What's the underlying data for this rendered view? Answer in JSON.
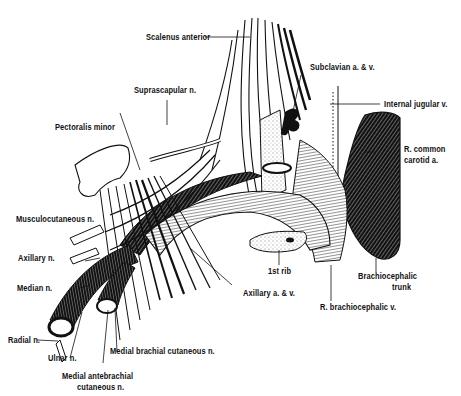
{
  "figure": {
    "type": "anatomical-illustration",
    "style": "black-and-white pen-and-ink line drawing",
    "colors": {
      "ink": "#111111",
      "background": "#ffffff"
    }
  },
  "labels": {
    "scalenus_anterior": "Scalenus anterior",
    "subclavian": "Subclavian a. & v.",
    "suprascapular": "Suprascapular n.",
    "internal_jugular": "Internal jugular v.",
    "pectoralis_minor": "Pectoralis minor",
    "r_common_carotid_1": "R. common",
    "r_common_carotid_2": "carotid a.",
    "musculocutaneous": "Musculocutaneous n.",
    "axillary_n": "Axillary n.",
    "median": "Median n.",
    "first_rib": "1st rib",
    "brachiocephalic_trunk_1": "Brachiocephalic",
    "brachiocephalic_trunk_2": "trunk",
    "axillary_av": "Axillary a. & v.",
    "r_brachiocephalic_v": "R. brachiocephalic v.",
    "radial": "Radial n.",
    "ulnar": "Ulnar n.",
    "medial_brachial_cutaneous": "Medial brachial cutaneous n.",
    "medial_antebrachial_1": "Medial antebrachial",
    "medial_antebrachial_2": "cutaneous n."
  }
}
